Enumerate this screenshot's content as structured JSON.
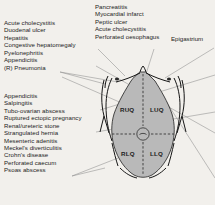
{
  "diagram": {
    "background_color": "#f2f0ec",
    "abdomen_fill": "#b9b9b9",
    "outline_color": "#1b1b1b",
    "leader_line_color": "#7a7a7a"
  },
  "left_upper_list": {
    "items": [
      "Acute cholecystitis",
      "Duodenal ulcer",
      "Hepatitis",
      "Congestive hepatomegaly",
      "Pyelonephritis",
      "Appendicitis",
      "(R) Pneumonia"
    ]
  },
  "left_lower_list": {
    "items": [
      "Appendicitis",
      "Salpingitis",
      "Tubo-ovarian abscess",
      "Ruptured ectopic pregnancy",
      "Renal/ureteric stone",
      "Strangulated hernia",
      "Mesenteric adenitis",
      "Meckel's diverticulitis",
      "Crohn's disease",
      "Perforated caecum",
      "Psoas abscess"
    ]
  },
  "top_center_list": {
    "items": [
      "Pancreatitis",
      "Myocardial infarct",
      "Peptic ulcer",
      "Acute cholecystitis",
      "Perforated oesophagus"
    ]
  },
  "epigastrium": {
    "label": "Epigastrium"
  },
  "quadrants": [
    {
      "code": "RUQ",
      "name": "right-upper-quadrant"
    },
    {
      "code": "LUQ",
      "name": "left-upper-quadrant"
    },
    {
      "code": "RLQ",
      "name": "right-lower-quadrant"
    },
    {
      "code": "LLQ",
      "name": "left-lower-quadrant"
    }
  ]
}
